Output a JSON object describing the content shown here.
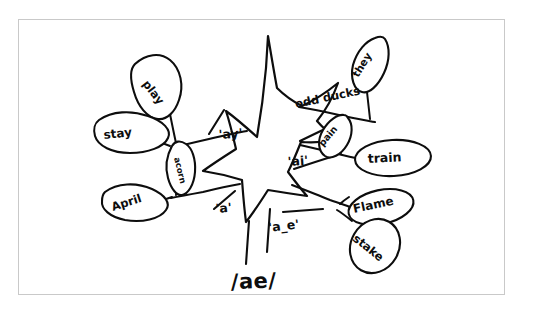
{
  "diagram": {
    "title_phoneme": "/ae/",
    "medium": "hand-drawn ink on white paper",
    "central_shape": "star-burst",
    "spelling_labels": [
      {
        "id": "ay",
        "text": "'ay'"
      },
      {
        "id": "ai",
        "text": "'ai'"
      },
      {
        "id": "a",
        "text": "'a'"
      },
      {
        "id": "a_e",
        "text": "'a_e'"
      }
    ],
    "odd_ducks_label": "odd ducks",
    "words": [
      {
        "id": "play",
        "text": "play",
        "shape": "leaf",
        "branch": "ay"
      },
      {
        "id": "stay",
        "text": "stay",
        "shape": "leaf",
        "branch": "ay"
      },
      {
        "id": "acorn",
        "text": "acorn",
        "shape": "leaf",
        "branch": "a"
      },
      {
        "id": "april",
        "text": "April",
        "shape": "leaf",
        "branch": "a"
      },
      {
        "id": "they",
        "text": "they",
        "shape": "leaf",
        "branch": "odd-ducks"
      },
      {
        "id": "pain",
        "text": "pain",
        "shape": "leaf",
        "branch": "ai"
      },
      {
        "id": "train",
        "text": "train",
        "shape": "oval",
        "branch": "ai"
      },
      {
        "id": "flame",
        "text": "Flame",
        "shape": "oval",
        "branch": "a_e"
      },
      {
        "id": "stake",
        "text": "stake",
        "shape": "oval",
        "branch": "a_e"
      }
    ],
    "colors": {
      "ink": "#0d0d0d",
      "paper": "#ffffff",
      "frame": "#c9c9c9"
    }
  }
}
